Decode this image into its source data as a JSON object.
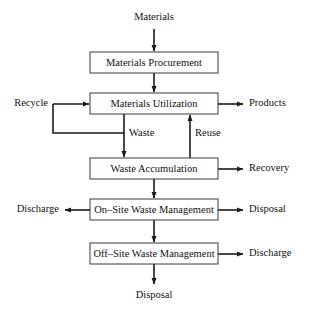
{
  "diagram": {
    "colors": {
      "box_fill": "#ffffff",
      "box_stroke": "#3a3a3a",
      "line": "#1a1a1a",
      "text": "#111111",
      "background": "#ffffff"
    },
    "nodes": [
      {
        "id": "materials_procurement",
        "label": "Materials Procurement"
      },
      {
        "id": "materials_utilization",
        "label": "Materials Utilization"
      },
      {
        "id": "waste_accumulation",
        "label": "Waste Accumulation"
      },
      {
        "id": "on_site_waste_mgmt",
        "label": "On–Site Waste Management"
      },
      {
        "id": "off_site_waste_mgmt",
        "label": "Off–Site Waste Management"
      }
    ],
    "edge_labels": {
      "materials_in": "Materials",
      "recycle": "Recycle",
      "products": "Products",
      "waste": "Waste",
      "reuse": "Reuse",
      "recovery": "Recovery",
      "discharge_on_site": "Discharge",
      "disposal_on_site": "Disposal",
      "discharge_off_site": "Discharge",
      "disposal_final": "Disposal"
    },
    "flows": [
      {
        "from": "Materials",
        "to": "Materials Procurement"
      },
      {
        "from": "Materials Procurement",
        "to": "Materials Utilization"
      },
      {
        "from": "Recycle",
        "to": "Materials Utilization"
      },
      {
        "from": "Materials Utilization",
        "to": "Products"
      },
      {
        "from": "Materials Utilization",
        "to": "Waste Accumulation",
        "label": "Waste"
      },
      {
        "from": "Waste Accumulation",
        "to": "Materials Utilization",
        "label": "Reuse"
      },
      {
        "from": "Waste",
        "to": "Recycle"
      },
      {
        "from": "Waste Accumulation",
        "to": "Recovery"
      },
      {
        "from": "Waste Accumulation",
        "to": "On–Site Waste Management"
      },
      {
        "from": "On–Site Waste Management",
        "to": "Discharge"
      },
      {
        "from": "On–Site Waste Management",
        "to": "Disposal"
      },
      {
        "from": "On–Site Waste Management",
        "to": "Off–Site Waste Management"
      },
      {
        "from": "Off–Site Waste Management",
        "to": "Discharge"
      },
      {
        "from": "Off–Site Waste Management",
        "to": "Disposal"
      }
    ]
  }
}
